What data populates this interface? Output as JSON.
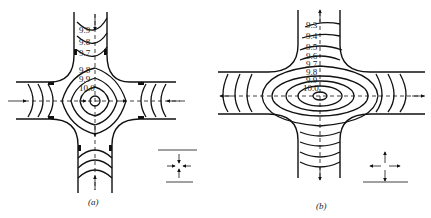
{
  "figure": {
    "panels": [
      {
        "id": "a",
        "caption": "(a)",
        "contour_labels_top_channel": [
          "9.9",
          "9.8",
          "9.7"
        ],
        "contour_labels_center": [
          "9.8",
          "9.9",
          "10.0"
        ],
        "flow_pattern": "inflow from all four arms toward center"
      },
      {
        "id": "b",
        "caption": "(b)",
        "contour_labels": [
          "9.3",
          "9.4",
          "9.5",
          "9.6",
          "9.7",
          "9.8",
          "9.9",
          "10.0"
        ],
        "flow_pattern": "outflow from center to all four arms"
      }
    ]
  }
}
